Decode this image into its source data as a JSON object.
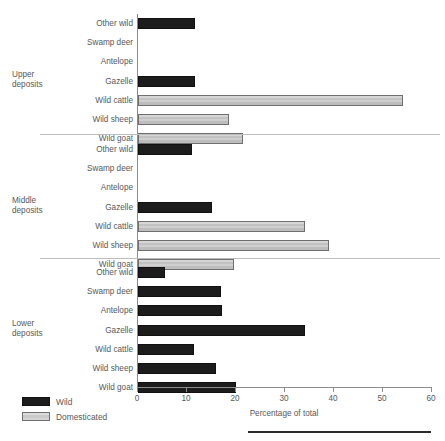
{
  "chart_data": {
    "type": "bar",
    "orientation": "horizontal",
    "title": "",
    "xlabel": "Percentage of total",
    "ylabel": "",
    "xlim": [
      0,
      60
    ],
    "xticks": [
      0,
      10,
      20,
      30,
      40,
      50,
      60
    ],
    "xtick_labels": [
      "0",
      "10",
      "20",
      "30",
      "40",
      "50",
      "60"
    ],
    "grid": false,
    "legend": {
      "position": "bottom-left",
      "entries": [
        {
          "label": "Wild",
          "color": "#1c1c1c",
          "key": "wild"
        },
        {
          "label": "Domesticated",
          "color": "#d2d2d2",
          "key": "domesticated"
        }
      ]
    },
    "categories": [
      "Other wild",
      "Swamp deer",
      "Antelope",
      "Gazelle",
      "Wild cattle",
      "Wild sheep",
      "Wild goat"
    ],
    "groups": [
      {
        "name": "Upper\ndeposits",
        "label_line1": "Upper",
        "label_line2": "deposits",
        "bars": [
          {
            "category": "Other wild",
            "value": 11.7,
            "type": "wild"
          },
          {
            "category": "Swamp deer",
            "value": 0,
            "type": "wild"
          },
          {
            "category": "Antelope",
            "value": 0,
            "type": "wild"
          },
          {
            "category": "Gazelle",
            "value": 11.7,
            "type": "wild"
          },
          {
            "category": "Wild cattle",
            "value": 54.0,
            "type": "domesticated"
          },
          {
            "category": "Wild sheep",
            "value": 18.5,
            "type": "domesticated"
          },
          {
            "category": "Wild goat",
            "value": 21.5,
            "type": "domesticated"
          }
        ]
      },
      {
        "name": "Middle\ndeposits",
        "label_line1": "Middle",
        "label_line2": "deposits",
        "bars": [
          {
            "category": "Other wild",
            "value": 11.0,
            "type": "wild"
          },
          {
            "category": "Swamp deer",
            "value": 0,
            "type": "wild"
          },
          {
            "category": "Antelope",
            "value": 0,
            "type": "wild"
          },
          {
            "category": "Gazelle",
            "value": 15.0,
            "type": "wild"
          },
          {
            "category": "Wild cattle",
            "value": 34.0,
            "type": "domesticated"
          },
          {
            "category": "Wild sheep",
            "value": 39.0,
            "type": "domesticated"
          },
          {
            "category": "Wild goat",
            "value": 19.5,
            "type": "domesticated"
          }
        ]
      },
      {
        "name": "Lower\ndeposits",
        "label_line1": "Lower",
        "label_line2": "deposits",
        "bars": [
          {
            "category": "Other wild",
            "value": 5.5,
            "type": "wild"
          },
          {
            "category": "Swamp deer",
            "value": 17.0,
            "type": "wild"
          },
          {
            "category": "Antelope",
            "value": 17.2,
            "type": "wild"
          },
          {
            "category": "Gazelle",
            "value": 34.0,
            "type": "wild"
          },
          {
            "category": "Wild cattle",
            "value": 11.5,
            "type": "wild"
          },
          {
            "category": "Wild sheep",
            "value": 16.0,
            "type": "wild"
          },
          {
            "category": "Wild goat",
            "value": 20.0,
            "type": "wild"
          }
        ]
      }
    ]
  }
}
